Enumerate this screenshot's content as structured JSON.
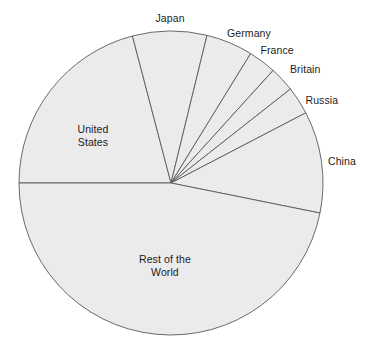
{
  "chart_data": {
    "type": "pie",
    "title": "",
    "subtitle": "",
    "xlabel": "",
    "ylabel": "",
    "legend_position": "none",
    "grid": false,
    "labels_placement": "around-slices",
    "geometry": {
      "center_x": 171,
      "center_y": 183,
      "radius": 152,
      "start_angle_deg": 180,
      "direction": "clockwise"
    },
    "style": {
      "slice_fill": "#ebebeb",
      "slice_stroke": "#5a5a5a",
      "background": "#ffffff",
      "label_color": "#1c1c1c"
    },
    "categories": [
      "United States",
      "Japan",
      "Germany",
      "France",
      "Britain",
      "Russia",
      "China",
      "Rest of the World"
    ],
    "values": [
      20.9,
      7.9,
      5.0,
      2.9,
      2.7,
      3.0,
      10.8,
      46.8
    ],
    "angles_deg": [
      75.3,
      28.4,
      17.9,
      10.6,
      9.6,
      10.7,
      38.9,
      168.6
    ],
    "slices": [
      {
        "name": "United States",
        "label": "United States",
        "label_lines": [
          "United",
          "States"
        ],
        "value": 20.9,
        "angle_deg": 75.3,
        "start_deg": 180.0,
        "end_deg": 104.7,
        "label_x": 93,
        "label_y": 123,
        "label_align": "center"
      },
      {
        "name": "Japan",
        "label": "Japan",
        "label_lines": [
          "Japan"
        ],
        "value": 7.9,
        "angle_deg": 28.4,
        "start_deg": 104.7,
        "end_deg": 76.3,
        "label_x": 170,
        "label_y": 12,
        "label_align": "center"
      },
      {
        "name": "Germany",
        "label": "Germany",
        "label_lines": [
          "Germany"
        ],
        "value": 5.0,
        "angle_deg": 17.9,
        "start_deg": 76.3,
        "end_deg": 58.4,
        "label_x": 249,
        "label_y": 27,
        "label_align": "center"
      },
      {
        "name": "France",
        "label": "France",
        "label_lines": [
          "France"
        ],
        "value": 2.9,
        "angle_deg": 10.6,
        "start_deg": 58.4,
        "end_deg": 47.8,
        "label_x": 277,
        "label_y": 44,
        "label_align": "center"
      },
      {
        "name": "Britain",
        "label": "Britain",
        "label_lines": [
          "Britain"
        ],
        "value": 2.7,
        "angle_deg": 9.6,
        "start_deg": 47.8,
        "end_deg": 38.2,
        "label_x": 305,
        "label_y": 63,
        "label_align": "center"
      },
      {
        "name": "Russia",
        "label": "Russia",
        "label_lines": [
          "Russia"
        ],
        "value": 3.0,
        "angle_deg": 10.7,
        "start_deg": 38.2,
        "end_deg": 27.5,
        "label_x": 322,
        "label_y": 94,
        "label_align": "center"
      },
      {
        "name": "China",
        "label": "China",
        "label_lines": [
          "China"
        ],
        "value": 10.8,
        "angle_deg": 38.9,
        "start_deg": 27.5,
        "end_deg": -11.4,
        "label_x": 342,
        "label_y": 155,
        "label_align": "center"
      },
      {
        "name": "Rest of the World",
        "label": "Rest of the World",
        "label_lines": [
          "Rest of the",
          "World"
        ],
        "value": 46.8,
        "angle_deg": 168.6,
        "start_deg": -11.4,
        "end_deg": -180.0,
        "label_x": 165,
        "label_y": 253,
        "label_align": "center"
      }
    ]
  }
}
